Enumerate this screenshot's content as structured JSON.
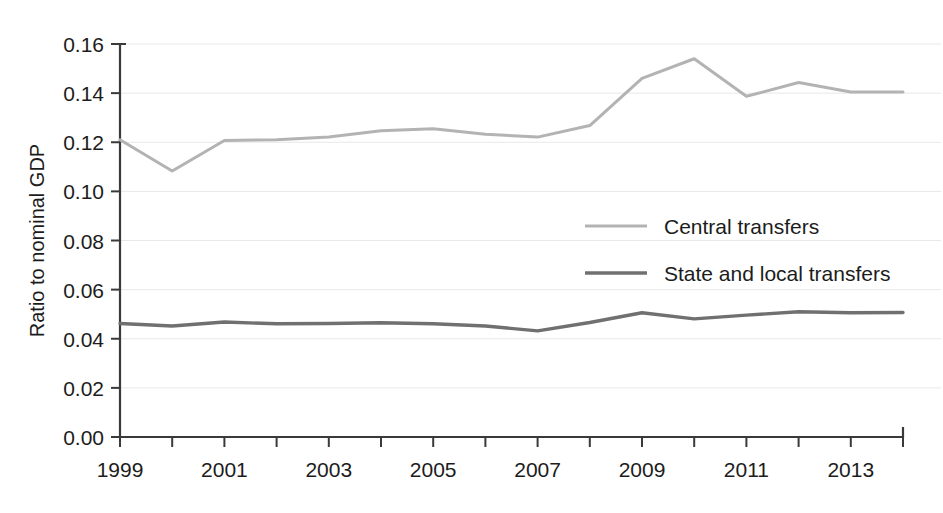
{
  "chart_data": {
    "type": "line",
    "title": "",
    "xlabel": "",
    "ylabel": "Ratio to nominal GDP",
    "x": [
      1999,
      2000,
      2001,
      2002,
      2003,
      2004,
      2005,
      2006,
      2007,
      2008,
      2009,
      2010,
      2011,
      2012,
      2013,
      2014
    ],
    "xlim": [
      1999,
      2014
    ],
    "ylim": [
      0.0,
      0.16
    ],
    "y_ticks": [
      0.0,
      0.02,
      0.04,
      0.06,
      0.08,
      0.1,
      0.12,
      0.14,
      0.16
    ],
    "y_tick_labels": [
      "0.00",
      "0.02",
      "0.04",
      "0.06",
      "0.08",
      "0.10",
      "0.12",
      "0.14",
      "0.16"
    ],
    "x_ticks": [
      1999,
      2000,
      2001,
      2002,
      2003,
      2004,
      2005,
      2006,
      2007,
      2008,
      2009,
      2010,
      2011,
      2012,
      2013,
      2014
    ],
    "x_tick_labels": [
      "1999",
      "",
      "2001",
      "",
      "2003",
      "",
      "2005",
      "",
      "2007",
      "",
      "2009",
      "",
      "2011",
      "",
      "2013",
      ""
    ],
    "grid": true,
    "grid_axis": "y",
    "legend_position": "center-right",
    "series": [
      {
        "name": "Central transfers",
        "color": "#b3b3b3",
        "values": [
          0.121,
          0.1083,
          0.1207,
          0.121,
          0.1221,
          0.1247,
          0.1255,
          0.1233,
          0.1221,
          0.1268,
          0.146,
          0.154,
          0.1387,
          0.1443,
          0.1405,
          0.1405
        ]
      },
      {
        "name": "State and local transfers",
        "color": "#707070",
        "values": [
          0.0462,
          0.0452,
          0.0468,
          0.0461,
          0.0462,
          0.0465,
          0.0461,
          0.0452,
          0.0432,
          0.0466,
          0.0506,
          0.0481,
          0.0496,
          0.051,
          0.0506,
          0.0507
        ]
      }
    ]
  },
  "legend": {
    "items": [
      {
        "label": "Central transfers",
        "color": "#b3b3b3"
      },
      {
        "label": "State and local transfers",
        "color": "#707070"
      }
    ]
  },
  "axes": {
    "y_title": "Ratio to nominal GDP"
  }
}
